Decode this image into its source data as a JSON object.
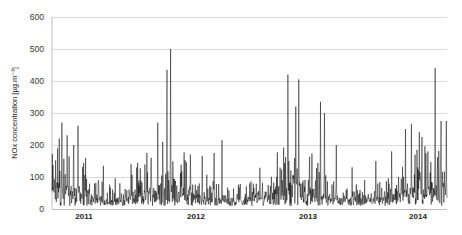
{
  "chart_data": {
    "type": "line",
    "title": "",
    "xlabel": "",
    "ylabel": "NOx concentration [µg.m⁻³]",
    "ylim": [
      0,
      600
    ],
    "yticks": [
      0,
      100,
      200,
      300,
      400,
      500,
      600
    ],
    "xtick_labels": [
      "2011",
      "2012",
      "2013",
      "2014"
    ],
    "grid": {
      "horizontal": true,
      "vertical": false
    },
    "legend": null,
    "series": [
      {
        "name": "NOx concentration",
        "color": "#000000",
        "description": "Daily/hourly NOx concentration time series from late 2010 to early 2014; baseline ~20-60, frequent spikes 100-270, winter peaks higher",
        "peaks": [
          {
            "x_frac": 0.025,
            "value": 270
          },
          {
            "x_frac": 0.038,
            "value": 230
          },
          {
            "x_frac": 0.066,
            "value": 260
          },
          {
            "x_frac": 0.018,
            "value": 220
          },
          {
            "x_frac": 0.055,
            "value": 200
          },
          {
            "x_frac": 0.085,
            "value": 160
          },
          {
            "x_frac": 0.13,
            "value": 135
          },
          {
            "x_frac": 0.2,
            "value": 140
          },
          {
            "x_frac": 0.24,
            "value": 175
          },
          {
            "x_frac": 0.268,
            "value": 270
          },
          {
            "x_frac": 0.291,
            "value": 435
          },
          {
            "x_frac": 0.3,
            "value": 500
          },
          {
            "x_frac": 0.28,
            "value": 210
          },
          {
            "x_frac": 0.35,
            "value": 170
          },
          {
            "x_frac": 0.38,
            "value": 165
          },
          {
            "x_frac": 0.41,
            "value": 175
          },
          {
            "x_frac": 0.43,
            "value": 215
          },
          {
            "x_frac": 0.5,
            "value": 80
          },
          {
            "x_frac": 0.6,
            "value": 150
          },
          {
            "x_frac": 0.625,
            "value": 180
          },
          {
            "x_frac": 0.597,
            "value": 420
          },
          {
            "x_frac": 0.617,
            "value": 320
          },
          {
            "x_frac": 0.625,
            "value": 405
          },
          {
            "x_frac": 0.68,
            "value": 335
          },
          {
            "x_frac": 0.69,
            "value": 300
          },
          {
            "x_frac": 0.72,
            "value": 200
          },
          {
            "x_frac": 0.76,
            "value": 130
          },
          {
            "x_frac": 0.82,
            "value": 150
          },
          {
            "x_frac": 0.86,
            "value": 180
          },
          {
            "x_frac": 0.895,
            "value": 250
          },
          {
            "x_frac": 0.91,
            "value": 265
          },
          {
            "x_frac": 0.93,
            "value": 240
          },
          {
            "x_frac": 0.97,
            "value": 440
          },
          {
            "x_frac": 0.985,
            "value": 275
          },
          {
            "x_frac": 0.998,
            "value": 275
          }
        ],
        "baseline_range": [
          10,
          60
        ],
        "n_points": 1200
      }
    ],
    "plot_area": {
      "left": 52,
      "top": 17,
      "right": 447,
      "bottom": 209
    },
    "xtick_positions": [
      84,
      196,
      308,
      418
    ]
  }
}
